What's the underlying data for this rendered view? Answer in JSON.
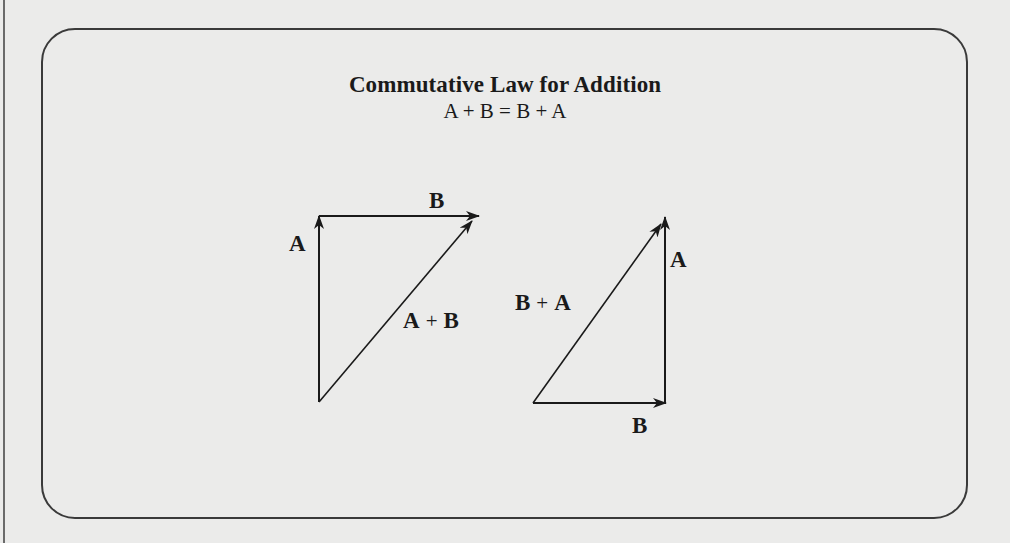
{
  "figure": {
    "title": "Commutative Law for Addition",
    "equation": "A + B = B + A"
  },
  "left_triangle": {
    "vector_a_label": "A",
    "vector_b_label": "B",
    "sum_label": {
      "left": "A",
      "op": "+",
      "right": "B"
    }
  },
  "right_triangle": {
    "vector_a_label": "A",
    "vector_b_label": "B",
    "sum_label": {
      "left": "B",
      "op": "+",
      "right": "A"
    }
  },
  "colors": {
    "background": "#ebebea",
    "ink": "#1a1a1a",
    "frame": "#3a3a3a"
  }
}
